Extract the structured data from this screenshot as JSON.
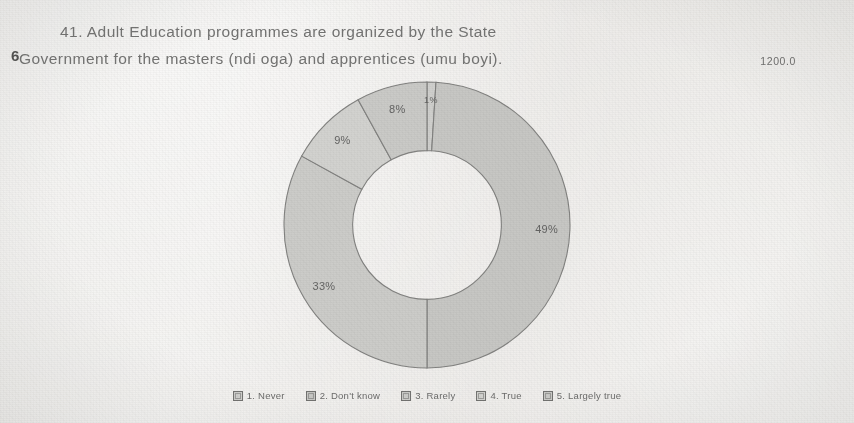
{
  "document": {
    "title_line_1": "41. Adult Education programmes are organized by the State",
    "title_line_2": "Government for the masters (ndi oga) and apprentices (umu boyi).",
    "stray_glyph": "6",
    "axis_max_label": "1200.0"
  },
  "chart_data": {
    "type": "pie",
    "variant": "doughnut",
    "title": "41. Adult Education programmes are organized by the State Government for the masters (ndi oga) and apprentices (umu boyi).",
    "xlabel": "",
    "ylabel": "",
    "legend_position": "bottom",
    "grid": false,
    "start_angle_deg": 0,
    "direction": "clockwise",
    "inner_radius_ratio": 0.52,
    "axis_max_label": "1200.0",
    "categories": [
      "1. Never",
      "2. Don't know",
      "3. Rarely",
      "4. True",
      "5. Largely true"
    ],
    "values": [
      1,
      49,
      33,
      9,
      8
    ],
    "data_labels": [
      "1%",
      "49%",
      "33%",
      "9%",
      "8%"
    ],
    "colors": [
      "#cfcfcc",
      "#c6c6c3",
      "#cbcbc8",
      "#d2d2cf",
      "#c9c9c6"
    ],
    "slices": [
      {
        "label": "1. Never",
        "value": 1,
        "data_label": "1%",
        "color": "#cfcfcc"
      },
      {
        "label": "2. Don't know",
        "value": 49,
        "data_label": "49%",
        "color": "#c6c6c3"
      },
      {
        "label": "3. Rarely",
        "value": 33,
        "data_label": "33%",
        "color": "#cbcbc8"
      },
      {
        "label": "4. True",
        "value": 9,
        "data_label": "9%",
        "color": "#d2d2cf"
      },
      {
        "label": "5. Largely true",
        "value": 8,
        "data_label": "8%",
        "color": "#c9c9c6"
      }
    ]
  },
  "legend": {
    "items": [
      {
        "label": "1. Never",
        "color": "#cfcfcc"
      },
      {
        "label": "2. Don't know",
        "color": "#c6c6c3"
      },
      {
        "label": "3. Rarely",
        "color": "#cbcbc8"
      },
      {
        "label": "4. True",
        "color": "#d2d2cf"
      },
      {
        "label": "5. Largely true",
        "color": "#c9c9c6"
      }
    ]
  }
}
